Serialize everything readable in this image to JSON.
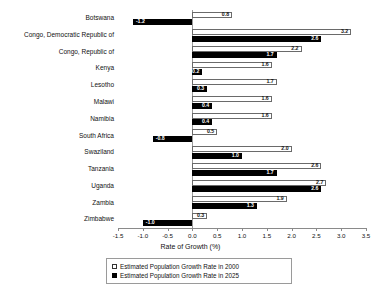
{
  "chart_data": {
    "type": "bar",
    "orientation": "horizontal",
    "title": "",
    "xlabel": "Rate of Growth (%)",
    "ylabel": "",
    "xlim": [
      -1.5,
      3.5
    ],
    "xticks": [
      "-1.5",
      "-1.0",
      "-0.5",
      "0.0",
      "0.5",
      "1.0",
      "1.5",
      "2.0",
      "2.5",
      "3.0",
      "3.5"
    ],
    "grid": false,
    "legend_position": "bottom",
    "categories": [
      "Botswana",
      "Congo, Democratic Republic of",
      "Congo, Republic of",
      "Kenya",
      "Lesotho",
      "Malawi",
      "Namibia",
      "South Africa",
      "Swaziland",
      "Tanzania",
      "Uganda",
      "Zambia",
      "Zimbabwe"
    ],
    "series": [
      {
        "name": "Estimated Population Growth Rate in 2000",
        "color": "#ffffff",
        "values": [
          0.8,
          3.2,
          2.2,
          1.6,
          1.7,
          1.6,
          1.6,
          0.5,
          2.0,
          2.6,
          2.7,
          1.9,
          0.3
        ],
        "labels": [
          "0.8",
          "3.2",
          "2.2",
          "1.6",
          "1.7",
          "1.6",
          "1.6",
          "0.5",
          "2.0",
          "2.6",
          "2.7",
          "1.9",
          "0.3"
        ]
      },
      {
        "name": "Estimated Population Growth Rate in 2025",
        "color": "#000000",
        "values": [
          -1.2,
          2.6,
          1.7,
          0.2,
          0.3,
          0.4,
          0.4,
          -0.8,
          1.0,
          1.7,
          2.6,
          1.3,
          -1.0
        ],
        "labels": [
          "-1.2",
          "2.6",
          "1.7",
          "0.2",
          "0.3",
          "0.4",
          "0.4",
          "-0.8",
          "1.0",
          "1.7",
          "2.6",
          "1.3",
          "-1.0"
        ]
      }
    ]
  },
  "legend": {
    "items": [
      {
        "label": "Estimated Population Growth Rate in 2000",
        "swatch": "white"
      },
      {
        "label": "Estimated Population Growth Rate in 2025",
        "swatch": "black"
      }
    ]
  }
}
